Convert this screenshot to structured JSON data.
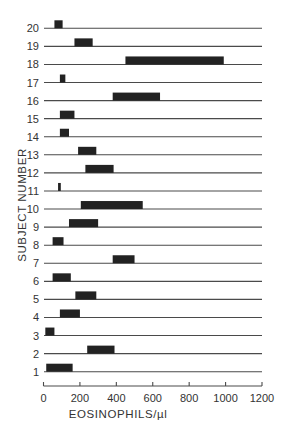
{
  "chart_data": {
    "type": "bar",
    "orientation": "horizontal-range",
    "title": "",
    "xlabel": "EOSINOPHILS/µl",
    "ylabel": "SUBJECT NUMBER",
    "xlim": [
      0,
      1200
    ],
    "xticks": [
      0,
      200,
      400,
      600,
      800,
      1000,
      1200
    ],
    "xtick_labels": [
      "0",
      "200",
      "400",
      "600",
      "800",
      "1000",
      "1200"
    ],
    "grid": false,
    "legend": null,
    "categories": [
      "1",
      "2",
      "3",
      "4",
      "5",
      "6",
      "7",
      "8",
      "9",
      "10",
      "11",
      "12",
      "13",
      "14",
      "15",
      "16",
      "17",
      "18",
      "19",
      "20"
    ],
    "ranges": [
      {
        "subject": "1",
        "low": 15,
        "high": 160
      },
      {
        "subject": "2",
        "low": 240,
        "high": 390
      },
      {
        "subject": "3",
        "low": 10,
        "high": 60
      },
      {
        "subject": "4",
        "low": 90,
        "high": 200
      },
      {
        "subject": "5",
        "low": 175,
        "high": 290
      },
      {
        "subject": "6",
        "low": 50,
        "high": 150
      },
      {
        "subject": "7",
        "low": 380,
        "high": 500
      },
      {
        "subject": "8",
        "low": 50,
        "high": 110
      },
      {
        "subject": "9",
        "low": 140,
        "high": 300
      },
      {
        "subject": "10",
        "low": 205,
        "high": 545
      },
      {
        "subject": "11",
        "low": 80,
        "high": 95
      },
      {
        "subject": "12",
        "low": 230,
        "high": 385
      },
      {
        "subject": "13",
        "low": 190,
        "high": 290
      },
      {
        "subject": "14",
        "low": 90,
        "high": 140
      },
      {
        "subject": "15",
        "low": 90,
        "high": 170
      },
      {
        "subject": "16",
        "low": 380,
        "high": 640
      },
      {
        "subject": "17",
        "low": 90,
        "high": 120
      },
      {
        "subject": "18",
        "low": 450,
        "high": 990
      },
      {
        "subject": "19",
        "low": 170,
        "high": 270
      },
      {
        "subject": "20",
        "low": 60,
        "high": 105
      }
    ],
    "colors": {
      "bar": "#222222",
      "line": "#4a4a4a",
      "text": "#333333"
    }
  }
}
